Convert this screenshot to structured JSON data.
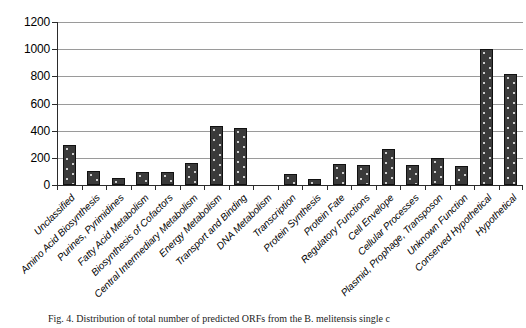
{
  "figure": {
    "caption": "Fig. 4. Distribution of total number of predicted ORFs from the B. melitensis single c"
  },
  "chart_data": {
    "type": "bar",
    "title": "",
    "xlabel": "",
    "ylabel": "",
    "ylim": [
      0,
      1200
    ],
    "yticks": [
      0,
      200,
      400,
      600,
      800,
      1000,
      1200
    ],
    "grid": true,
    "legend": false,
    "bar_color": "#3a3a3a",
    "categories": [
      "Unclassified",
      "Amino Acid Biosynthesis",
      "Purines, Pyrimidines",
      "Fatty Acid Metabolism",
      "Biosynthesis of Cofactors",
      "Central Intermediary Metabolism",
      "Energy Metabolism",
      "Transport and Binding",
      "DNA Metabolism",
      "Transcription",
      "Protein Synthesis",
      "Protein Fate",
      "Regulatory Functions",
      "Cell Envelope",
      "Cellular Processes",
      "Plasmid, Prophage, Transposon",
      "Unknown Function",
      "Conserved Hypothetical",
      "Hypothetical"
    ],
    "values": [
      295,
      100,
      50,
      95,
      95,
      165,
      435,
      420,
      0,
      80,
      45,
      155,
      150,
      265,
      150,
      200,
      140,
      1000,
      820
    ]
  }
}
